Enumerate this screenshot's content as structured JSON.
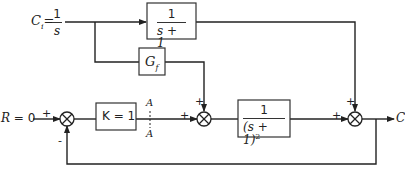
{
  "input_disturbance": {
    "symbol": "C",
    "subscript": "i",
    "eq": "=",
    "num": "1",
    "den": "s"
  },
  "reference": {
    "label": "R = 0"
  },
  "output": {
    "label": "C"
  },
  "blocks": {
    "disturbance_path": {
      "num": "1",
      "den": "s + 1"
    },
    "feedforward": {
      "symbol": "G",
      "subscript": "f"
    },
    "controller": {
      "label": "K = 1"
    },
    "process": {
      "num": "1",
      "den": "(s + 1)",
      "power": "2"
    }
  },
  "cut_point": {
    "top": "A",
    "bottom": "A"
  },
  "signs": {
    "sum1_input": "+",
    "sum1_feedback": "-",
    "sum2_left": "+",
    "sum2_top": "+",
    "sum3_left": "+",
    "sum3_top": "+"
  }
}
